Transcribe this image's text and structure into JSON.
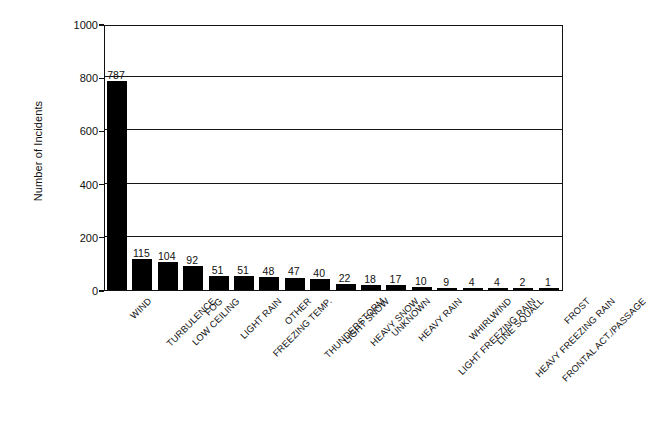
{
  "chart_data": {
    "type": "bar",
    "title": "",
    "xlabel": "",
    "ylabel": "Number of Incidents",
    "ylim": [
      0,
      1000
    ],
    "yticks": [
      0,
      200,
      400,
      600,
      800,
      1000
    ],
    "grid": "horizontal",
    "legend": "none",
    "orientation": "vertical",
    "bar_color": "#000000",
    "categories": [
      "WIND",
      "TURBULENCE",
      "LOW CEILING",
      "FOG",
      "LIGHT RAIN",
      "FREEZING TEMP.",
      "OTHER",
      "THUNDERSTORM",
      "LIGHT SNOW",
      "HEAVY SNOW",
      "UNKNOWN",
      "HEAVY RAIN",
      "LIGHT FREEZING RAIN",
      "WHIRLWIND",
      "LINE SQUALL",
      "HEAVY FREEZING RAIN",
      "FRONTAL ACT./PASSAGE",
      "FROST"
    ],
    "values": [
      787,
      115,
      104,
      92,
      51,
      51,
      48,
      47,
      40,
      22,
      18,
      17,
      10,
      9,
      4,
      4,
      2,
      1
    ],
    "value_labels": [
      "787",
      "115",
      "104",
      "92",
      "51",
      "51",
      "48",
      "47",
      "40",
      "22",
      "18",
      "17",
      "10",
      "9",
      "4",
      "4",
      "2",
      "1"
    ],
    "ytick_labels": [
      "0",
      "200",
      "400",
      "600",
      "800",
      "1000"
    ]
  },
  "axis": {
    "y_title": "Number of Incidents"
  },
  "colors": {
    "bar": "#000000",
    "axis": "#111111",
    "grid": "#151515",
    "background": "#ffffff"
  }
}
